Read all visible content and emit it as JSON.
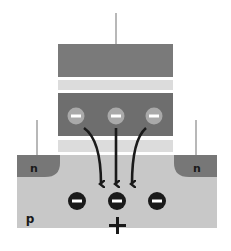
{
  "diagram": {
    "colors": {
      "gate": "#7a7a7a",
      "oxide": "#dcdcdc",
      "storage_layer": "#6e6e6e",
      "substrate": "#c8c8c8",
      "n_region": "#777777",
      "lead": "#b8b8b8",
      "arrow": "#1a1a1a",
      "electron_stored": "#a9a9a9",
      "electron_channel": "#1a1a1a"
    },
    "labels": {
      "n_left": "n",
      "n_right": "n",
      "substrate": "p",
      "plus": "+",
      "minus": "−"
    },
    "stored_charges": [
      {
        "sign": "−"
      },
      {
        "sign": "−"
      },
      {
        "sign": "−"
      }
    ],
    "channel_charges": [
      {
        "sign": "−"
      },
      {
        "sign": "−"
      },
      {
        "sign": "−"
      }
    ],
    "arrows": [
      {
        "from": "stored-charge-1",
        "to": "channel",
        "direction": "down"
      },
      {
        "from": "stored-charge-2",
        "to": "channel",
        "direction": "down"
      },
      {
        "from": "stored-charge-3",
        "to": "channel",
        "direction": "down"
      }
    ]
  }
}
